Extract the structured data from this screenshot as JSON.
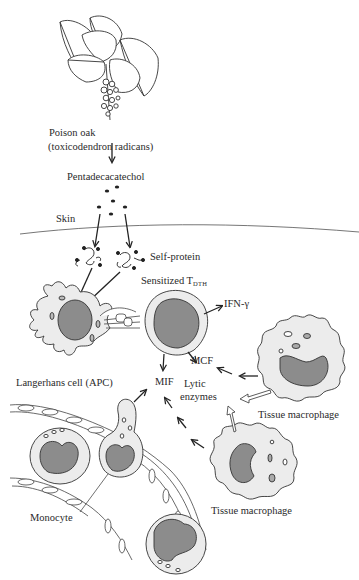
{
  "diagram": {
    "type": "flow",
    "labels": {
      "plant": "Poison oak",
      "plant_species": "(toxicodendron radicans)",
      "hapten": "Pentadecacatechol",
      "skin": "Skin",
      "self_protein": "Self-protein",
      "sensitized_t": "Sensitized T",
      "sensitized_t_sub": "DTH",
      "ifn": "IFN-γ",
      "mcf": "MCF",
      "mif": "MIF",
      "lytic_line1": "Lytic",
      "lytic_line2": "enzymes",
      "langerhans": "Langerhans cell (APC)",
      "macrophage_top": "Tissue macrophage",
      "macrophage_bottom": "Tissue macrophage",
      "monocyte": "Monocyte"
    },
    "nodes": [
      {
        "id": "plant",
        "label": "Poison oak (toxicodendron radicans)",
        "icon": "plant-icon"
      },
      {
        "id": "hapten",
        "label": "Pentadecacatechol"
      },
      {
        "id": "skin",
        "label": "Skin"
      },
      {
        "id": "self_protein",
        "label": "Self-protein"
      },
      {
        "id": "apc",
        "label": "Langerhans cell (APC)",
        "icon": "dendritic-cell-icon"
      },
      {
        "id": "tdth",
        "label": "Sensitized T DTH",
        "icon": "t-cell-icon"
      },
      {
        "id": "ifn",
        "label": "IFN-γ"
      },
      {
        "id": "mcf",
        "label": "MCF"
      },
      {
        "id": "mif",
        "label": "MIF"
      },
      {
        "id": "lytic",
        "label": "Lytic enzymes"
      },
      {
        "id": "mac1",
        "label": "Tissue macrophage",
        "icon": "macrophage-icon"
      },
      {
        "id": "mac2",
        "label": "Tissue macrophage",
        "icon": "macrophage-icon"
      },
      {
        "id": "monocyte",
        "label": "Monocyte",
        "icon": "monocyte-icon"
      }
    ],
    "edges": [
      {
        "from": "plant",
        "to": "hapten"
      },
      {
        "from": "hapten",
        "to": "self_protein"
      },
      {
        "from": "self_protein",
        "to": "apc"
      },
      {
        "from": "apc",
        "to": "tdth"
      },
      {
        "from": "tdth",
        "to": "ifn"
      },
      {
        "from": "tdth",
        "to": "mcf"
      },
      {
        "from": "tdth",
        "to": "mif"
      },
      {
        "from": "mac1",
        "to": "mcf"
      },
      {
        "from": "mac1",
        "to": "lytic"
      },
      {
        "from": "mac2",
        "to": "mif"
      },
      {
        "from": "mac2",
        "to": "lytic"
      },
      {
        "from": "monocyte",
        "to": "mif"
      }
    ],
    "colors": {
      "cell_fill": "#ececec",
      "nucleus_fill": "#8c8c8c",
      "stroke": "#333333",
      "background": "#ffffff"
    }
  }
}
